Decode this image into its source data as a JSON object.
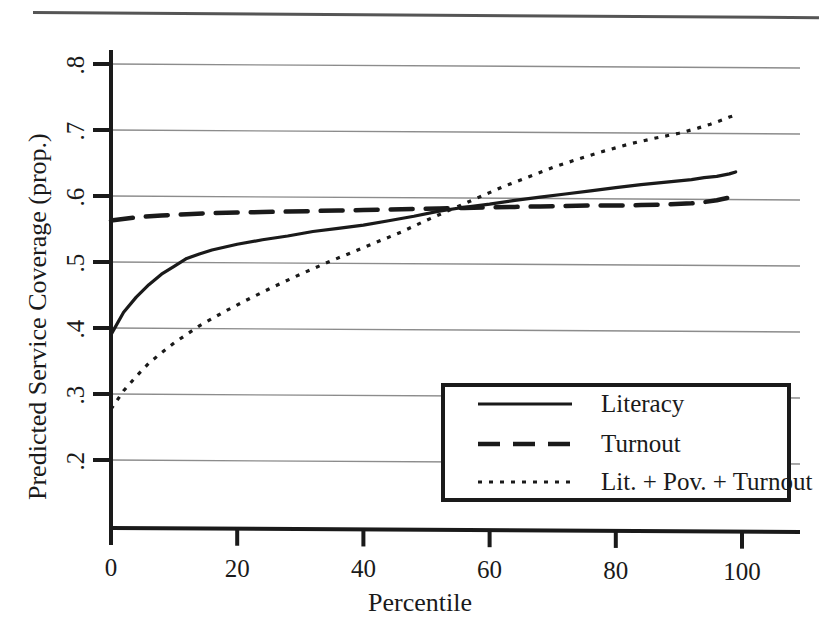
{
  "figure": {
    "background_color": "#ffffff",
    "ink_color": "#1a1a1a",
    "grid_color": "#8c8c8c",
    "has_top_rule": true
  },
  "chart_data": {
    "type": "line",
    "title": "",
    "xlabel": "Percentile",
    "ylabel": "Predicted Service Coverage (prop.)",
    "xlim": [
      -2,
      107
    ],
    "ylim": [
      0.18,
      0.835
    ],
    "xticks": [
      0,
      20,
      40,
      60,
      80,
      100
    ],
    "xtick_labels": [
      "0",
      "20",
      "40",
      "60",
      "80",
      "100"
    ],
    "yticks": [
      0.2,
      0.3,
      0.4,
      0.5,
      0.6,
      0.7,
      0.8
    ],
    "ytick_labels": [
      ".2",
      ".3",
      ".4",
      ".5",
      ".6",
      ".7",
      ".8"
    ],
    "grid": "horizontal",
    "legend_position": "lower right",
    "series": [
      {
        "name": "Literacy",
        "style": "solid",
        "x": [
          0,
          2,
          4,
          6,
          8,
          10,
          12,
          14,
          16,
          20,
          24,
          28,
          32,
          36,
          40,
          44,
          48,
          52,
          56,
          60,
          64,
          68,
          72,
          76,
          80,
          84,
          88,
          92,
          94,
          96,
          98,
          99
        ],
        "y": [
          0.39,
          0.424,
          0.447,
          0.466,
          0.482,
          0.494,
          0.506,
          0.513,
          0.519,
          0.528,
          0.535,
          0.541,
          0.548,
          0.553,
          0.558,
          0.565,
          0.572,
          0.58,
          0.586,
          0.591,
          0.597,
          0.602,
          0.607,
          0.612,
          0.617,
          0.622,
          0.626,
          0.63,
          0.633,
          0.635,
          0.639,
          0.642
        ]
      },
      {
        "name": "Turnout",
        "style": "dashed",
        "x": [
          0,
          4,
          8,
          12,
          16,
          20,
          24,
          28,
          32,
          36,
          40,
          44,
          48,
          52,
          56,
          60,
          64,
          68,
          72,
          76,
          80,
          84,
          88,
          92,
          94,
          96,
          98,
          99
        ],
        "y": [
          0.563,
          0.568,
          0.571,
          0.573,
          0.575,
          0.576,
          0.577,
          0.578,
          0.579,
          0.58,
          0.581,
          0.582,
          0.583,
          0.584,
          0.585,
          0.586,
          0.587,
          0.588,
          0.589,
          0.59,
          0.59,
          0.591,
          0.592,
          0.594,
          0.596,
          0.599,
          0.603,
          0.605
        ]
      },
      {
        "name": "Lit. + Pov. + Turnout",
        "style": "dotted",
        "x": [
          0,
          2,
          4,
          6,
          8,
          10,
          14,
          18,
          22,
          26,
          30,
          34,
          38,
          42,
          46,
          50,
          54,
          58,
          62,
          66,
          70,
          74,
          78,
          82,
          86,
          90,
          93,
          95,
          97,
          98,
          99
        ],
        "y": [
          0.277,
          0.305,
          0.327,
          0.347,
          0.363,
          0.378,
          0.404,
          0.426,
          0.446,
          0.465,
          0.483,
          0.5,
          0.516,
          0.532,
          0.548,
          0.566,
          0.583,
          0.6,
          0.617,
          0.632,
          0.647,
          0.66,
          0.672,
          0.683,
          0.692,
          0.7,
          0.708,
          0.714,
          0.721,
          0.725,
          0.728
        ]
      }
    ]
  },
  "legend": {
    "entries": [
      {
        "label": "Literacy",
        "style": "solid"
      },
      {
        "label": "Turnout",
        "style": "dashed"
      },
      {
        "label": "Lit. + Pov. + Turnout",
        "style": "dotted"
      }
    ]
  }
}
